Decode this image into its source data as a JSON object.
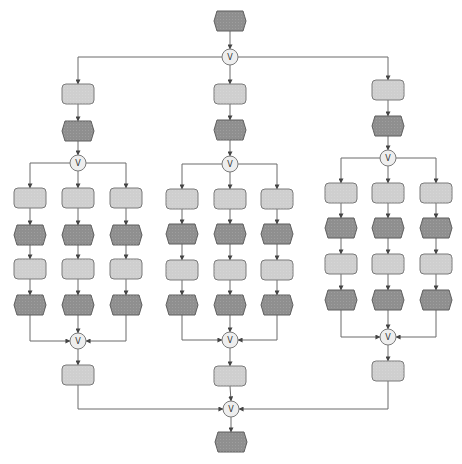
{
  "diagram": {
    "type": "EPC process flow",
    "connector_label": "V",
    "legend": {
      "function": "rounded rectangle (light gray)",
      "event": "hexagon (dark gray)",
      "connector": "circle with logical OR symbol"
    },
    "colors": {
      "function_fill": "#cfcfcf",
      "event_fill": "#8f8f8f",
      "connector_fill": "#eeeeee",
      "edge": "#6a6a6a"
    },
    "structure": {
      "start": "event",
      "split": "connector",
      "branches": [
        {
          "name": "branch-left",
          "head": [
            "function",
            "event"
          ],
          "split": "connector",
          "columns": [
            [
              "function",
              "event",
              "function",
              "event"
            ],
            [
              "function",
              "event",
              "function",
              "event"
            ],
            [
              "function",
              "event",
              "function",
              "event"
            ]
          ],
          "join": "connector",
          "tail": [
            "function"
          ]
        },
        {
          "name": "branch-middle",
          "head": [
            "function",
            "event"
          ],
          "split": "connector",
          "columns": [
            [
              "function",
              "event",
              "function",
              "event"
            ],
            [
              "function",
              "event",
              "function",
              "event"
            ],
            [
              "function",
              "event",
              "function",
              "event"
            ]
          ],
          "join": "connector",
          "tail": [
            "function"
          ]
        },
        {
          "name": "branch-right",
          "head": [
            "function",
            "event"
          ],
          "split": "connector",
          "columns": [
            [
              "function",
              "event",
              "function",
              "event"
            ],
            [
              "function",
              "event",
              "function",
              "event"
            ],
            [
              "function",
              "event",
              "function",
              "event"
            ]
          ],
          "join": "connector",
          "tail": [
            "function"
          ]
        }
      ],
      "join": "connector",
      "end": "event"
    }
  }
}
